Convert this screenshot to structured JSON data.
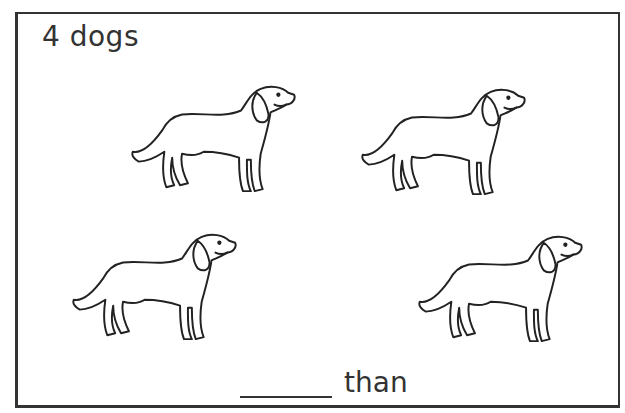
{
  "worksheet": {
    "title": "4 dogs",
    "caption_suffix": "than",
    "answer_blank": "",
    "count": 4,
    "subject": "dogs",
    "pictures": [
      {
        "icon": "dog-icon",
        "x": 125,
        "y": 82
      },
      {
        "icon": "dog-icon",
        "x": 355,
        "y": 85
      },
      {
        "icon": "dog-icon",
        "x": 66,
        "y": 230
      },
      {
        "icon": "dog-icon",
        "x": 412,
        "y": 232
      }
    ],
    "colors": {
      "line": "#333333",
      "background": "#ffffff"
    }
  }
}
